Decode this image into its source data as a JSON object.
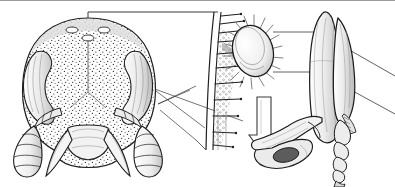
{
  "figure": {
    "style": "pen-and-ink stipple scientific illustration",
    "background_color": "#ffffff",
    "ink_color": "#1a1a1a",
    "line_color": "#2b2b2b",
    "stipple_color": "#333333",
    "wash_color": "#cfcfcf",
    "border": {
      "name": "top-rule",
      "color": "#9a9a9a",
      "position": "top",
      "thickness_px": 1
    }
  },
  "panels": [
    {
      "id": "head",
      "name": "ant-head-frontal-view",
      "label": "",
      "description": "Frontal view of an ant head with stippled surface, paired ocelli on the vertex, large lateral eyes, mandibles and two segmented antennae",
      "bbox": [
        6,
        8,
        185,
        179
      ],
      "parts": [
        {
          "name": "vertex",
          "description": "top of head with stipple shading"
        },
        {
          "name": "ocellus-left",
          "description": "small oval ocellus left of midline"
        },
        {
          "name": "ocellus-right",
          "description": "small oval ocellus right of midline"
        },
        {
          "name": "median-ocellus",
          "description": "small ocellus at midline below vertex"
        },
        {
          "name": "compound-eye-left",
          "description": "large crescent eye, left"
        },
        {
          "name": "compound-eye-right",
          "description": "large crescent eye, right"
        },
        {
          "name": "frons",
          "description": "central stippled frontal area"
        },
        {
          "name": "clypeus",
          "description": "lower pale shield region"
        },
        {
          "name": "mandible-left",
          "description": "curved left mandible"
        },
        {
          "name": "mandible-right",
          "description": "curved right mandible"
        },
        {
          "name": "antenna-left",
          "description": "left antenna, scape and segmented club"
        },
        {
          "name": "antenna-right",
          "description": "right antenna, scape and segmented club"
        }
      ]
    },
    {
      "id": "mite-detail",
      "name": "mite-detail-panel",
      "label": "",
      "description": "Enlarged cutaway of cuticle surface bearing setae, a granular secretion layer, and an oval hairy mite attached to the surface; a hollow arrow points downward",
      "bbox": [
        196,
        10,
        290,
        160
      ],
      "parts": [
        {
          "name": "cuticle-wall",
          "description": "vertical curved cuticle section drawn as a double line"
        },
        {
          "name": "setae",
          "description": "row of stiff bristles projecting to the right from the cuticle"
        },
        {
          "name": "granular-layer",
          "description": "stippled granular secretion against the cuticle"
        },
        {
          "name": "mite-body",
          "description": "oval mite body with fringe of radiating hairs"
        },
        {
          "name": "down-arrow",
          "description": "hollow outlined arrow pointing down"
        }
      ]
    },
    {
      "id": "leg",
      "name": "ant-leg-panel",
      "label": "",
      "description": "Elongated ant leg: femur and tibia side by side, segmented tarsus, and the pretarsus with claws shown at lower left",
      "bbox": [
        255,
        8,
        392,
        180
      ],
      "parts": [
        {
          "name": "femur",
          "description": "broad elongate segment"
        },
        {
          "name": "tibia",
          "description": "slender segment alongside the femur"
        },
        {
          "name": "tibial-spur",
          "description": "comb-like spur at the tibia apex"
        },
        {
          "name": "tarsus",
          "description": "five segmented tarsomeres"
        },
        {
          "name": "pretarsus-claws",
          "description": "terminal claw / foot structure at lower left"
        }
      ]
    }
  ],
  "leaders": [
    {
      "name": "leader-vertex-to-detail",
      "from": "head vertex",
      "to": "mite-detail panel top",
      "style": "solid thin"
    },
    {
      "name": "leader-head-to-detail-upper",
      "from": "head right margin",
      "to": "mite-detail panel lower left",
      "style": "solid thin"
    },
    {
      "name": "leader-head-to-detail-lower",
      "from": "head right margin",
      "to": "mite-detail panel lower left",
      "style": "solid thin"
    },
    {
      "name": "leader-detail-to-leg-upper",
      "from": "mite body",
      "to": "leg upper region",
      "style": "solid thin"
    },
    {
      "name": "leader-detail-to-leg-lower",
      "from": "mite body",
      "to": "leg mid region",
      "style": "solid thin"
    }
  ]
}
